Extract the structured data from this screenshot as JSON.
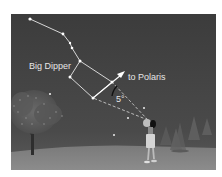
{
  "diagram": {
    "labels": {
      "constellation": "Big Dipper",
      "direction": "to Polaris",
      "angle": "5°"
    },
    "colors": {
      "sky_top": "#3e3e3e",
      "sky_bottom": "#4a4a4a",
      "ground": "#8a8a8a",
      "lines": "#e8e8e8",
      "stars": "#ffffff",
      "text": "#e6e6e6"
    },
    "stars": [
      {
        "name": "alkaid",
        "x": 30,
        "y": 19
      },
      {
        "name": "mizar",
        "x": 63,
        "y": 34
      },
      {
        "name": "alioth-a",
        "x": 70,
        "y": 43
      },
      {
        "name": "alioth",
        "x": 72,
        "y": 48
      },
      {
        "name": "megrez",
        "x": 80,
        "y": 61
      },
      {
        "name": "phecda",
        "x": 70,
        "y": 77
      },
      {
        "name": "merak",
        "x": 93,
        "y": 98
      },
      {
        "name": "dubhe",
        "x": 112,
        "y": 82
      }
    ]
  }
}
